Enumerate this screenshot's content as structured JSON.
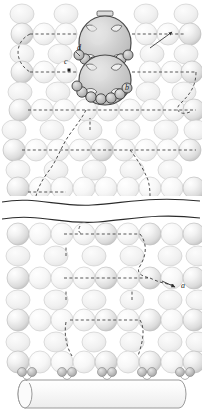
{
  "figure": {
    "width": 202,
    "height": 420,
    "background": "#ffffff"
  },
  "labels": [
    {
      "id": "a",
      "text": "a",
      "x": 181,
      "y": 286,
      "desc": "pathway-a-terminal-particle"
    },
    {
      "id": "b",
      "text": "b",
      "x": 125,
      "y": 88,
      "desc": "receptor-ring-lower-body"
    },
    {
      "id": "c",
      "text": "c",
      "x": 64,
      "y": 62,
      "desc": "interstitial-site-marker"
    },
    {
      "id": "d",
      "text": "d",
      "x": 78,
      "y": 48,
      "desc": "inter-body-junction"
    }
  ],
  "markers": {
    "c_point": {
      "x": 69,
      "y": 70,
      "size": 3,
      "color": "#1a1a1a"
    }
  },
  "colors": {
    "outline": "#6e6e6e",
    "sphere_light": "#fdfdfd",
    "sphere_mid": "#e9e9e9",
    "sphere_dark": "#cfcfcf",
    "ellipse_fill": "#f0f0f0",
    "ellipse_outline": "#c9c9c9",
    "body_fill": "#c9c9c9",
    "body_outline": "#4a4a4a",
    "receptor_fill": "#b9b9b9",
    "receptor_outline": "#3f3f3f",
    "dash_color": "#3a3a3a",
    "break_line": "#2b2b2b",
    "cylinder_fill": "#f7f7f7",
    "cylinder_outline": "#9a9a9a",
    "label_color": "#1a1a1a"
  },
  "lattice": {
    "sphere_rows_y": [
      34,
      70,
      106,
      142,
      178,
      248,
      284,
      320,
      356
    ],
    "ellipse_rows_y": [
      14,
      52,
      88,
      124,
      160,
      196,
      230,
      266,
      302,
      338,
      370
    ],
    "sphere_radius": 11,
    "ellipse_rx": 12,
    "ellipse_ry": 10,
    "column_pitch": 22
  },
  "bodies": [
    {
      "name": "upper-capsid",
      "cx": 105,
      "cy": 43,
      "rx": 26,
      "ry": 27,
      "has_top_tab": true,
      "receptor_count": 7,
      "inner_notches": 4
    },
    {
      "name": "lower-capsid",
      "cx": 105,
      "cy": 80,
      "rx": 26,
      "ry": 25,
      "has_top_tab": false,
      "receptor_count": 7,
      "inner_notches": 4
    }
  ],
  "break_indicator": {
    "name": "figure-break",
    "upper_y": 198,
    "lower_y": 220,
    "style": "wavy"
  },
  "cylinder": {
    "name": "substrate-cylinder",
    "x": 18,
    "y": 378,
    "width": 168,
    "height": 30,
    "cap_rx": 7
  },
  "paths": {
    "pathway_a": "descending zig-zag route ending at labelled particle a",
    "pathway_b": "receptor ring of lower capsid",
    "pathway_c": "interstitial lattice site between rows",
    "pathway_d": "junction between the two stacked capsids"
  }
}
